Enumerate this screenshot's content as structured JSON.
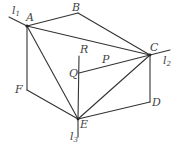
{
  "diagram": {
    "stroke_color": "#333333",
    "points": {
      "A": {
        "label": "A",
        "x": 27,
        "y": 26
      },
      "B": {
        "label": "B",
        "x": 78,
        "y": 13
      },
      "C": {
        "label": "C",
        "x": 150,
        "y": 55
      },
      "D": {
        "label": "D",
        "x": 150,
        "y": 102
      },
      "E": {
        "label": "E",
        "x": 78,
        "y": 119
      },
      "F": {
        "label": "F",
        "x": 27,
        "y": 90
      },
      "R": {
        "label": "R",
        "x": 79,
        "y": 56
      },
      "Q": {
        "label": "Q",
        "x": 79,
        "y": 73
      },
      "P": {
        "label": "P",
        "x": 103,
        "y": 67
      }
    },
    "lines": {
      "l1": {
        "label": "l",
        "sub": "1"
      },
      "l2": {
        "label": "l",
        "sub": "2"
      },
      "l3": {
        "label": "l",
        "sub": "3"
      }
    }
  }
}
